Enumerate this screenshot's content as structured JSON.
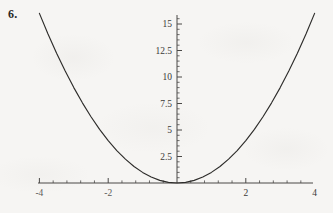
{
  "problem": {
    "number": "6."
  },
  "chart_data": {
    "type": "line",
    "title": "",
    "subtitle": "",
    "xlabel": "",
    "ylabel": "",
    "function": "y = x^2",
    "grid": false,
    "legend": null,
    "xlim": [
      -4.2,
      4.2
    ],
    "ylim": [
      0,
      16.8
    ],
    "x_axis": {
      "major_ticks": [
        -4,
        -2,
        2,
        4
      ],
      "major_tick_labels": [
        "-4",
        "-2",
        "2",
        "4"
      ],
      "minor_tick_step": 0.4,
      "axis_line_value": 0
    },
    "y_axis": {
      "major_ticks": [
        2.5,
        5,
        7.5,
        10,
        12.5,
        15
      ],
      "major_tick_labels": [
        "2.5",
        "5",
        "7.5",
        "10",
        "12.5",
        "15"
      ],
      "minor_tick_step": 0.5,
      "axis_line_value": 0
    },
    "x": [
      -4,
      -3.75,
      -3.5,
      -3.25,
      -3,
      -2.75,
      -2.5,
      -2.25,
      -2,
      -1.75,
      -1.5,
      -1.25,
      -1,
      -0.75,
      -0.5,
      -0.25,
      0,
      0.25,
      0.5,
      0.75,
      1,
      1.25,
      1.5,
      1.75,
      2,
      2.25,
      2.5,
      2.75,
      3,
      3.25,
      3.5,
      3.75,
      4
    ],
    "values": [
      16,
      14.0625,
      12.25,
      10.5625,
      9,
      7.5625,
      6.25,
      5.0625,
      4,
      3.0625,
      2.25,
      1.5625,
      1,
      0.5625,
      0.25,
      0.0625,
      0,
      0.0625,
      0.25,
      0.5625,
      1,
      1.5625,
      2.25,
      3.0625,
      4,
      5.0625,
      6.25,
      7.5625,
      9,
      10.5625,
      12.25,
      14.0625,
      16
    ],
    "colors": {
      "curve": "#2e2d2b",
      "axis": "#4a4947",
      "label": "#3a3937",
      "background": "#f6f5f3"
    }
  }
}
